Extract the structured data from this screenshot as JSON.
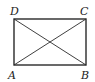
{
  "figure": {
    "type": "rectangle-with-diagonals",
    "colors": {
      "stroke": "#2a2a2a",
      "label": "#222222",
      "background": "#ffffff"
    },
    "vertices": {
      "A": {
        "label": "A",
        "x": 14,
        "y": 65
      },
      "B": {
        "label": "B",
        "x": 86,
        "y": 65
      },
      "C": {
        "label": "C",
        "x": 86,
        "y": 19
      },
      "D": {
        "label": "D",
        "x": 14,
        "y": 19
      }
    },
    "labels": {
      "A": "A",
      "B": "B",
      "C": "C",
      "D": "D"
    },
    "edges": [
      "AB",
      "BC",
      "CD",
      "DA"
    ],
    "diagonals": [
      "AC",
      "BD"
    ]
  }
}
